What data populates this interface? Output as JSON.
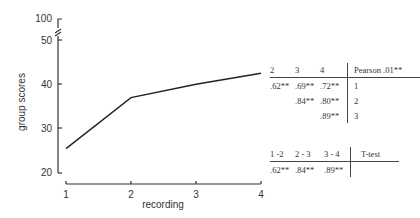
{
  "chart_data": {
    "type": "line",
    "title": "",
    "xlabel": "recording",
    "ylabel": "group scores",
    "x": [
      1,
      2,
      3,
      4
    ],
    "series": [
      {
        "name": "group scores",
        "values": [
          25.5,
          37,
          40,
          42.5
        ]
      }
    ],
    "x_ticks": [
      "1",
      "2",
      "3",
      "4"
    ],
    "y_ticks": [
      "20",
      "30",
      "40",
      "50",
      "100"
    ],
    "ylim": [
      20,
      100
    ],
    "y_axis_break": "between 50 and 100",
    "grid": false,
    "legend": "none"
  },
  "pearson_table": {
    "header": [
      "2",
      "3",
      "4",
      "Pearson  .01**"
    ],
    "rows": [
      {
        "cells": [
          ".62**",
          ".69**",
          ".72**"
        ],
        "label": "1"
      },
      {
        "cells": [
          "",
          ".84**",
          ".80**"
        ],
        "label": "2"
      },
      {
        "cells": [
          "",
          "",
          ".89**"
        ],
        "label": "3"
      }
    ]
  },
  "ttest_table": {
    "header": [
      "1 -2",
      "2 - 3",
      "3 - 4",
      "T-test"
    ],
    "row": [
      ".62**",
      ".84**",
      ".89**",
      ""
    ]
  }
}
